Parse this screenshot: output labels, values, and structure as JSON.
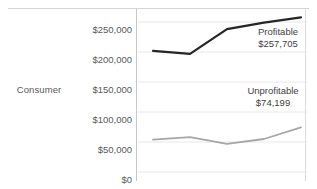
{
  "chart_data": {
    "type": "line",
    "title": "",
    "subtitle": "",
    "row_label": "Consumer",
    "xlabel": "",
    "ylabel": "",
    "ylim": [
      0,
      250000
    ],
    "grid": true,
    "grid_axis": "y",
    "legend_position": "none",
    "annotations_position": "right-inline",
    "y_ticks": [
      {
        "value": 250000,
        "label": "$250,000"
      },
      {
        "value": 200000,
        "label": "$200,000"
      },
      {
        "value": 150000,
        "label": "$150,000"
      },
      {
        "value": 100000,
        "label": "$100,000"
      },
      {
        "value": 50000,
        "label": "$50,000"
      },
      {
        "value": 0,
        "label": "$0"
      }
    ],
    "x_tick_labels": [],
    "x": [
      1,
      2,
      3,
      4,
      5
    ],
    "series": [
      {
        "name": "Profitable",
        "color": "#262626",
        "end_label": "Profitable",
        "end_value_label": "$257,705",
        "end_value": 257705,
        "values": [
          202000,
          197000,
          238000,
          249000,
          257705
        ]
      },
      {
        "name": "Unprofitable",
        "color": "#a6a6a6",
        "end_label": "Unprofitable",
        "end_value_label": "$74,199",
        "end_value": 74199,
        "values": [
          54000,
          58000,
          47000,
          55000,
          74199
        ]
      }
    ]
  },
  "annotations": {
    "profitable": {
      "name": "Profitable",
      "value": "$257,705"
    },
    "unprofitable": {
      "name": "Unprofitable",
      "value": "$74,199"
    }
  },
  "colors": {
    "profitable_line": "#262626",
    "unprofitable_line": "#a6a6a6",
    "gridline": "#e8e8e8",
    "axis": "#c9c9c9",
    "text": "#5a5a5a"
  }
}
